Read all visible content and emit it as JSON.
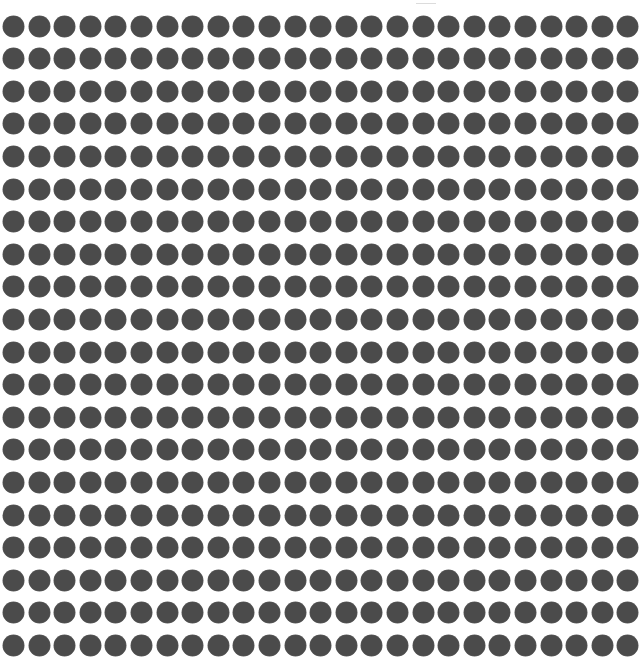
{
  "canvas": {
    "width": 642,
    "height": 658,
    "background": "#ffffff"
  },
  "dot_grid": {
    "rows": 20,
    "cols": 25,
    "dot_diameter_x": 21,
    "dot_diameter_y": 21,
    "first_center_x": 13.5,
    "first_center_y": 26,
    "pitch_x": 25.6,
    "pitch_y": 32.6,
    "dot_color": "#4b4b4b",
    "dot_edge_color": "#5a5a5a",
    "shape": "circle-icon"
  },
  "top_mark": {
    "x": 416,
    "y": 3,
    "width": 20,
    "color": "#9a9a9a"
  }
}
